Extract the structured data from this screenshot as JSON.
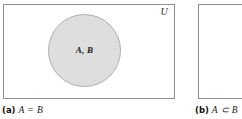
{
  "figure": {
    "kind": "venn-diagram-pair",
    "colors": {
      "box_border": "#8d8d8d",
      "circle_fill": "#dedede",
      "circle_border": "#aeaeae",
      "text": "#1a1a1a",
      "background": "#ffffff"
    }
  },
  "panel_a": {
    "universe_label": "U",
    "circle_label": "A, B",
    "caption_tag": "(a)",
    "caption_expr": "A = B"
  },
  "panel_b": {
    "caption_tag": "(b)",
    "caption_expr": "A ⊂ B"
  }
}
